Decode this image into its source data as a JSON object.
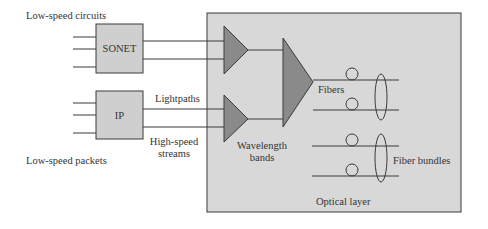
{
  "diagram": {
    "colors": {
      "background": "#ffffff",
      "optical_layer_fill": "#d8d8d8",
      "client_box_fill": "#cfcfcf",
      "triangle_fill": "#8a8a8a",
      "line": "#3a3a3a",
      "text": "#333333"
    },
    "nodes": {
      "sonet": {
        "label": "SONET"
      },
      "ip": {
        "label": "IP"
      },
      "optical_layer": {
        "label": "Optical layer"
      }
    },
    "labels": {
      "low_speed_circuits": "Low-speed circuits",
      "low_speed_packets": "Low-speed packets",
      "lightpaths": "Lightpaths",
      "high_speed_line1": "High-speed",
      "high_speed_line2": "streams",
      "wavelength_line1": "Wavelength",
      "wavelength_line2": "bands",
      "fibers": "Fibers",
      "fiber_bundles": "Fiber bundles"
    }
  }
}
